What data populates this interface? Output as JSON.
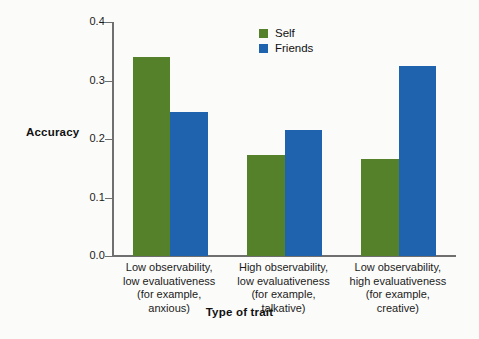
{
  "chart_data": {
    "type": "bar",
    "title": "",
    "xlabel": "Type of trait",
    "ylabel": "Accuracy",
    "ylim": [
      0.0,
      0.4
    ],
    "yticks": [
      "0.0",
      "0.1",
      "0.2",
      "0.3",
      "0.4"
    ],
    "ytick_values": [
      0.0,
      0.1,
      0.2,
      0.3,
      0.4
    ],
    "grid": false,
    "legend_position": "top-center",
    "categories": [
      "Low observability, low evaluativeness (for example, anxious)",
      "High observability, low evaluativeness (for example, talkative)",
      "Low observability, high evaluativeness (for example, creative)"
    ],
    "category_lines": [
      [
        "Low observability,",
        "low evaluativeness",
        "(for example,",
        "anxious)"
      ],
      [
        "High observability,",
        "low evaluativeness",
        "(for example,",
        "talkative)"
      ],
      [
        "Low observability,",
        "high evaluativeness",
        "(for example,",
        "creative)"
      ]
    ],
    "series": [
      {
        "name": "Self",
        "color": "#55812a",
        "values": [
          0.341,
          0.172,
          0.166
        ]
      },
      {
        "name": "Friends",
        "color": "#1f63ae",
        "values": [
          0.246,
          0.215,
          0.325
        ]
      }
    ]
  },
  "legend": {
    "items": [
      {
        "label": "Self"
      },
      {
        "label": "Friends"
      }
    ]
  },
  "axes": {
    "y_title": "Accuracy",
    "x_title": "Type of trait"
  },
  "colors": {
    "self": "#55812a",
    "friends": "#1f63ae",
    "axis": "#6f6f6f",
    "text": "#1b1b1b",
    "background": "#fbfbfa"
  }
}
